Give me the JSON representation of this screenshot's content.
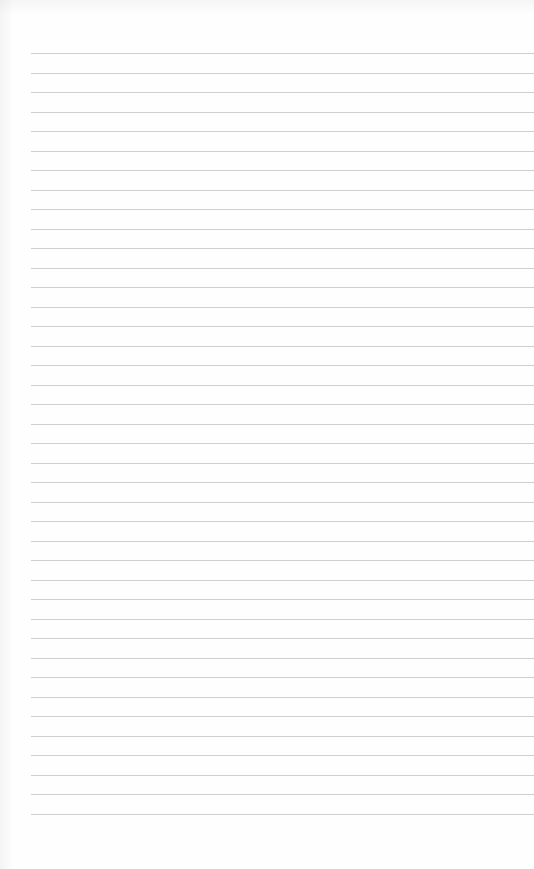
{
  "page": {
    "type": "blank lined paper",
    "background_color": "#fefefe",
    "line_color": "#cfcfcf",
    "line_count": 40,
    "first_line_y": 53,
    "line_spacing": 19.5,
    "left_start_x": 31,
    "text": ""
  }
}
